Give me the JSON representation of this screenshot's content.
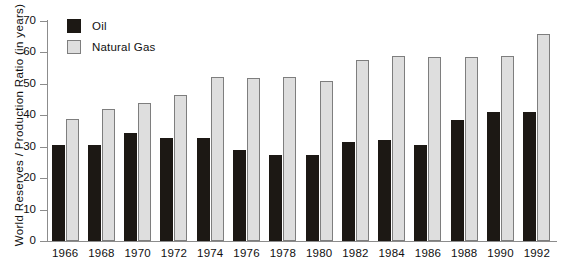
{
  "chart_data": {
    "type": "bar",
    "title": "",
    "xlabel": "",
    "ylabel": "World Reserves / Production Ratio (in years)",
    "ylim": [
      0,
      70
    ],
    "yticks": [
      0,
      10,
      20,
      30,
      40,
      50,
      60,
      70
    ],
    "grid": false,
    "legend_position": "top-left",
    "categories": [
      "1966",
      "1968",
      "1970",
      "1972",
      "1974",
      "1976",
      "1978",
      "1980",
      "1982",
      "1984",
      "1986",
      "1988",
      "1990",
      "1992"
    ],
    "series": [
      {
        "name": "Oil",
        "color": "#1c1814",
        "values": [
          30.5,
          30.5,
          34.3,
          32.7,
          32.7,
          29.0,
          27.4,
          27.4,
          31.5,
          32.0,
          30.7,
          38.5,
          41.0,
          41.0
        ]
      },
      {
        "name": "Natural Gas",
        "color": "#dedede",
        "values": [
          38.8,
          42.0,
          44.0,
          46.5,
          52.3,
          52.0,
          52.3,
          51.0,
          57.5,
          58.8,
          58.5,
          58.7,
          59.0,
          65.8
        ]
      }
    ]
  },
  "legend": {
    "items": [
      {
        "label": "Oil",
        "swatch": "filled-dark-square-icon"
      },
      {
        "label": "Natural Gas",
        "swatch": "filled-light-square-icon"
      }
    ]
  }
}
